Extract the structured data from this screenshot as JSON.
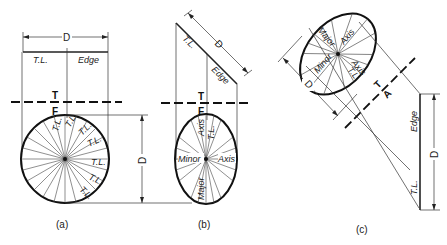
{
  "figure": {
    "panels": [
      {
        "id": "a",
        "caption": "(a)",
        "top_view": {
          "dimension": "D",
          "left_label": "T.L.",
          "right_label": "Edge"
        },
        "fold_line": {
          "upper": "T",
          "lower": "F"
        },
        "front_view": {
          "shape": "circle",
          "spoke_labels": "T.L.",
          "dimension": "D"
        }
      },
      {
        "id": "b",
        "caption": "(b)",
        "top_view": {
          "dimension": "D",
          "left_label": "T.L.",
          "right_label": "Edge"
        },
        "fold_line": {
          "upper": "T",
          "lower": "F"
        },
        "front_view": {
          "shape": "ellipse",
          "minor_label": "Minor",
          "axis_label_1": "Axis",
          "major_label": "Major",
          "axis_label_2": "Axis",
          "tl_label": "T.L."
        }
      },
      {
        "id": "c",
        "caption": "(c)",
        "aux_view": {
          "shape": "ellipse",
          "major_label": "Major",
          "axis_label_1": "Axis",
          "minor_label": "Minor",
          "axis_label_2": "Axis",
          "tl_label": "T.L.",
          "dimension": "D"
        },
        "fold_line": {
          "upper": "T",
          "lower": "A"
        },
        "top_view": {
          "edge_label": "Edge",
          "tl_label": "T.L.",
          "dimension": "D"
        }
      }
    ],
    "common": {
      "tl": "T.L.",
      "d": "D"
    }
  }
}
